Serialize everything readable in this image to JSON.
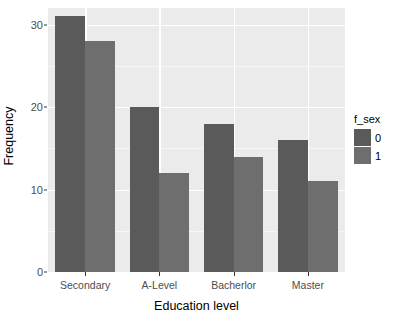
{
  "chart_data": {
    "type": "bar",
    "title": "",
    "xlabel": "Education level",
    "ylabel": "Frequency",
    "categories": [
      "Secondary",
      "A-Level",
      "Bacherlor",
      "Master"
    ],
    "series": [
      {
        "name": "0",
        "values": [
          31,
          20,
          18,
          16
        ],
        "color": "#5a5a5a"
      },
      {
        "name": "1",
        "values": [
          28,
          12,
          14,
          11
        ],
        "color": "#6e6e6e"
      }
    ],
    "legend": {
      "title": "f_sex",
      "position": "right",
      "entries": [
        "0",
        "1"
      ]
    },
    "ylim": [
      0,
      32
    ],
    "yticks": [
      0,
      10,
      20,
      30
    ],
    "ytick_labels": [
      "0",
      "10",
      "20",
      "30"
    ],
    "yminor_ticks": [
      5,
      15,
      25
    ],
    "grid": true,
    "panel_background": "#ebebeb",
    "gridline_color": "#ffffff"
  }
}
